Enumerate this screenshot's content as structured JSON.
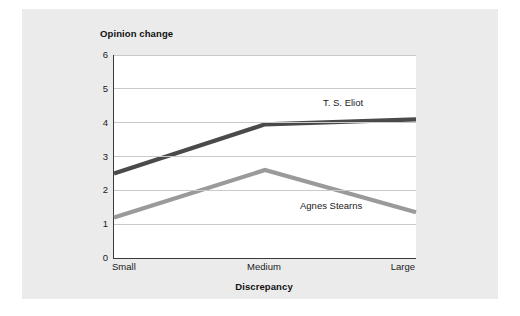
{
  "chart_data": {
    "type": "line",
    "title": "Opinion change",
    "xlabel": "Discrepancy",
    "ylabel": "Opinion change",
    "categories": [
      "Small",
      "Medium",
      "Large"
    ],
    "ylim": [
      0,
      6
    ],
    "yticks": [
      "0",
      "1",
      "2",
      "3",
      "4",
      "5",
      "6"
    ],
    "grid": true,
    "legend_position": "inline-at-line-ends",
    "series": [
      {
        "name": "T. S. Eliot",
        "values": [
          2.5,
          3.95,
          4.1
        ],
        "color": "#4a4a4a"
      },
      {
        "name": "Agnes Stearns",
        "values": [
          1.2,
          2.6,
          1.35
        ],
        "color": "#9a9a9a"
      }
    ],
    "annotations": [
      {
        "text": "T. S. Eliot",
        "near": "Large"
      },
      {
        "text": "Agnes Stearns",
        "near": "Large"
      }
    ]
  },
  "colors": {
    "panel_background": "#ebebeb",
    "plot_background": "#ffffff",
    "axis": "#3a3a3a",
    "gridline": "#c9c9c9",
    "text": "#1a1a1a",
    "series_eliot": "#4a4a4a",
    "series_stearns": "#9a9a9a"
  }
}
